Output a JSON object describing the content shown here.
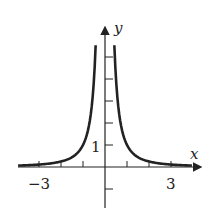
{
  "chart_data": {
    "type": "line",
    "title": "",
    "function": "y = 1/x^2",
    "xlabel": "x",
    "ylabel": "y",
    "tick_labels": {
      "x": [
        "−3",
        "3"
      ],
      "y": [
        "1"
      ]
    },
    "xlim": [
      -4.5,
      4.2
    ],
    "ylim": [
      -2,
      6.5
    ],
    "x_ticks": [
      -3,
      -2,
      -1,
      1,
      2,
      3
    ],
    "y_ticks": [
      -1,
      1,
      2,
      3,
      4,
      5
    ],
    "grid": false,
    "legend": null,
    "series": [
      {
        "name": "left branch",
        "x": [
          -4,
          -3,
          -2,
          -1,
          -0.6,
          -0.42
        ],
        "y": [
          0.0625,
          0.111,
          0.25,
          1,
          2.78,
          5.7
        ]
      },
      {
        "name": "right branch",
        "x": [
          0.42,
          0.6,
          1,
          2,
          3,
          4
        ],
        "y": [
          5.7,
          2.78,
          1,
          0.25,
          0.111,
          0.0625
        ]
      }
    ]
  }
}
